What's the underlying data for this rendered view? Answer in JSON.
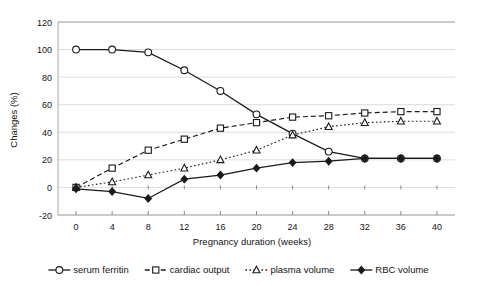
{
  "chart_data": {
    "type": "line",
    "title": "",
    "xlabel": "Pregnancy duration (weeks)",
    "ylabel": "Changes (%)",
    "x": [
      0,
      4,
      8,
      12,
      16,
      20,
      24,
      28,
      32,
      36,
      40
    ],
    "xticklabels": [
      "0",
      "4",
      "8",
      "12",
      "16",
      "20",
      "24",
      "28",
      "32",
      "36",
      "40"
    ],
    "yticklabels": [
      "-20",
      "0",
      "20",
      "40",
      "60",
      "80",
      "100",
      "120"
    ],
    "yticks": [
      -20,
      0,
      20,
      40,
      60,
      80,
      100,
      120
    ],
    "xlim": [
      -2,
      42
    ],
    "ylim": [
      -20,
      120
    ],
    "grid": true,
    "legend_position": "bottom",
    "series": [
      {
        "name": "serum ferritin",
        "marker": "open-circle",
        "line": "solid",
        "color": "#1a1a1a",
        "values": [
          100,
          100,
          98,
          85,
          70,
          53,
          39,
          26,
          21,
          21,
          21
        ]
      },
      {
        "name": "cardiac output",
        "marker": "open-square",
        "line": "dashed",
        "color": "#1a1a1a",
        "values": [
          0,
          14,
          27,
          35,
          43,
          47,
          51,
          52,
          54,
          55,
          55
        ]
      },
      {
        "name": "plasma volume",
        "marker": "open-triangle",
        "line": "dotted",
        "color": "#1a1a1a",
        "values": [
          0,
          4,
          9,
          14,
          20,
          27,
          38,
          44,
          47,
          48,
          48
        ]
      },
      {
        "name": "RBC volume",
        "marker": "filled-diamond",
        "line": "solid",
        "color": "#1a1a1a",
        "values": [
          -1,
          -3,
          -8,
          6,
          9,
          14,
          18,
          19,
          21,
          21,
          21
        ]
      }
    ]
  },
  "legend": {
    "items": [
      {
        "label": "serum ferritin",
        "marker": "open-circle",
        "line": "solid"
      },
      {
        "label": "cardiac output",
        "marker": "open-square",
        "line": "dashed"
      },
      {
        "label": "plasma volume",
        "marker": "open-triangle",
        "line": "dotted"
      },
      {
        "label": "RBC volume",
        "marker": "filled-diamond",
        "line": "solid"
      }
    ]
  }
}
